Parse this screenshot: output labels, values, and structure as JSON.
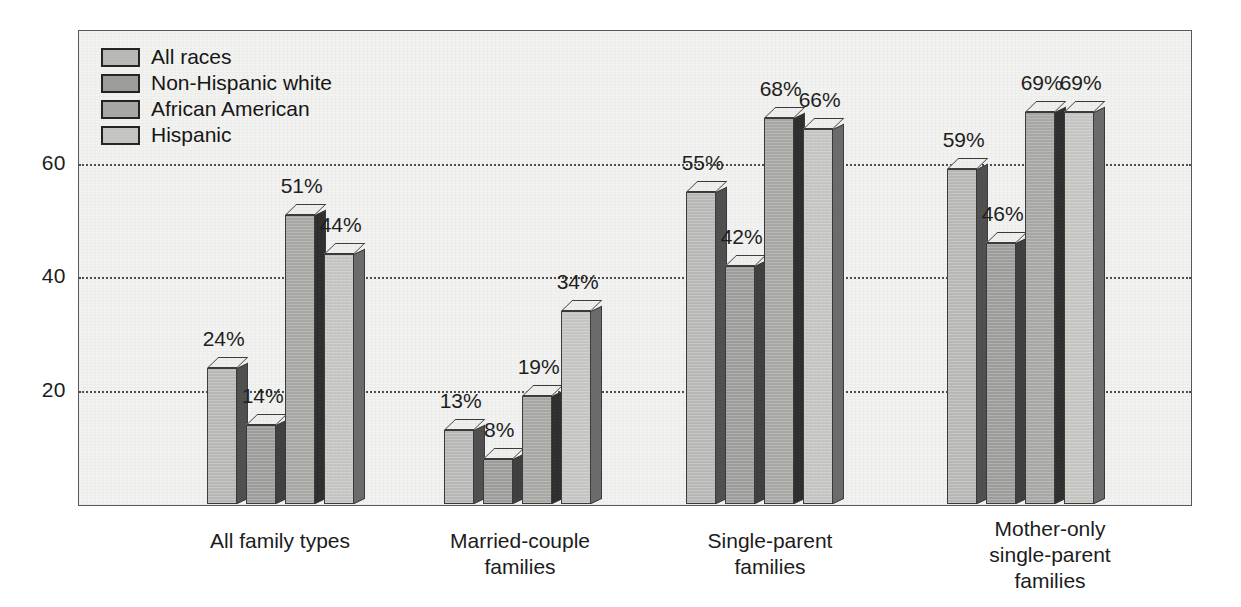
{
  "chart_data": {
    "type": "bar",
    "title": "",
    "xlabel": "",
    "ylabel": "",
    "ylim": [
      0,
      75
    ],
    "yticks": [
      20,
      40,
      60
    ],
    "ytick_labels": [
      "20",
      "40",
      "60"
    ],
    "grid": true,
    "legend_position": "top-left-inside",
    "value_suffix": "%",
    "categories": [
      "All family types",
      "Married-couple\nfamilies",
      "Single-parent\nfamilies",
      "Mother-only\nsingle-parent\nfamilies"
    ],
    "series": [
      {
        "name": "All races",
        "values": [
          24,
          13,
          55,
          59
        ],
        "labels": [
          "24%",
          "13%",
          "55%",
          "59%"
        ],
        "color": "#b9b9b7"
      },
      {
        "name": "Non-Hispanic white",
        "values": [
          14,
          8,
          42,
          46
        ],
        "labels": [
          "14%",
          "8%",
          "42%",
          "46%"
        ],
        "color": "#9d9d9b"
      },
      {
        "name": "African American",
        "values": [
          51,
          19,
          68,
          69
        ],
        "labels": [
          "51%",
          "19%",
          "68%",
          "69%"
        ],
        "color": "#a8a8a5"
      },
      {
        "name": "Hispanic",
        "values": [
          44,
          34,
          66,
          69
        ],
        "labels": [
          "44%",
          "34%",
          "66%",
          "69%"
        ],
        "color": "#c6c6c3"
      }
    ]
  },
  "legend": {
    "items": [
      {
        "label": "All races"
      },
      {
        "label": "Non-Hispanic white"
      },
      {
        "label": "African American"
      },
      {
        "label": "Hispanic"
      }
    ]
  }
}
